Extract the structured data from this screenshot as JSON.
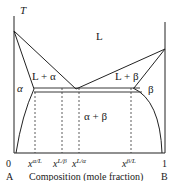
{
  "diagram": {
    "type": "binary eutectic phase diagram",
    "y_axis_label": "T",
    "regions": {
      "liquid": "L",
      "liquid_alpha": "L + α",
      "liquid_beta": "L + β",
      "alpha": "α",
      "beta": "β",
      "alpha_beta": "α + β"
    },
    "x_ticks": {
      "zero": "0",
      "one": "1",
      "x_alpha_L": {
        "base": "x",
        "sup": "α/L"
      },
      "x_L_beta": {
        "base": "x",
        "sup": "L/β"
      },
      "x_L_alpha": {
        "base": "x",
        "sup": "L/α"
      },
      "x_beta_L": {
        "base": "x",
        "sup": "β/L"
      }
    },
    "x_axis_label": "Composition (mole fraction)",
    "left_component": "A",
    "right_component": "B",
    "colors": {
      "line": "#222222",
      "text": "#1a1a1a",
      "background": "#ffffff"
    }
  }
}
